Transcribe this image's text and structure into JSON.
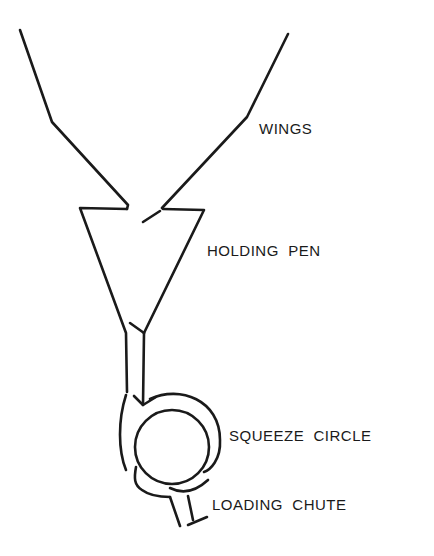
{
  "labels": {
    "wings": "WINGS",
    "holding_pen": "HOLDING  PEN",
    "squeeze_circle": "SQUEEZE  CIRCLE",
    "loading_chute": "LOADING  CHUTE"
  },
  "colors": {
    "stroke": "#1a1a1a",
    "background": "#ffffff"
  }
}
